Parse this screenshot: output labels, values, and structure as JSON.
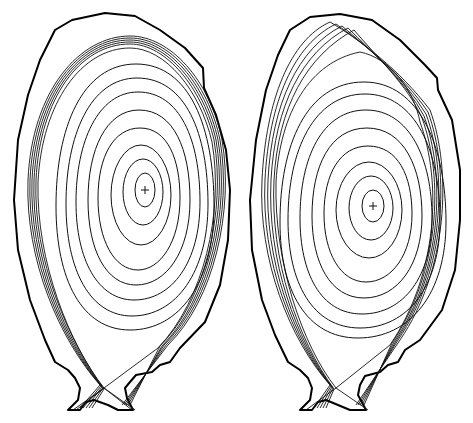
{
  "figure": {
    "panel_count": 2,
    "panels": [
      {
        "id": "left",
        "label": "",
        "magnetic_axis": {
          "x": 145,
          "y": 190,
          "marker": "+"
        },
        "closed_flux_surface_count": 10,
        "sol_lines_count": 7,
        "separatrix": "lower single null",
        "colors": {
          "wall": "#000000",
          "contours": "#111111"
        }
      },
      {
        "id": "right",
        "label": "",
        "magnetic_axis": {
          "x": 373,
          "y": 206,
          "marker": "+"
        },
        "closed_flux_surface_count": 10,
        "sol_lines_count": 7,
        "separatrix": "lower single null",
        "colors": {
          "wall": "#000000",
          "contours": "#111111"
        }
      }
    ],
    "background": "#ffffff"
  }
}
